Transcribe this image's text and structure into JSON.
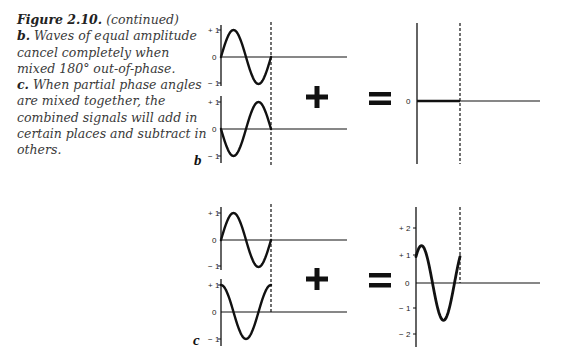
{
  "caption": {
    "figure_label": "Figure 2.10.",
    "figure_note": "(continued)",
    "b_label": "b.",
    "b_text": "Waves of equal amplitude cancel completely when mixed 180° out-of-phase.",
    "c_label": "c.",
    "c_text": "When partial phase angles are mixed together, the combined signals will add in certain places and subtract in others."
  },
  "panels": {
    "b": {
      "letter": "b",
      "wave1_ticks": [
        "+ 1",
        "0",
        "− 1"
      ],
      "wave2_ticks": [
        "+ 1",
        "0",
        "− 1"
      ],
      "result_ticks": [
        "0"
      ],
      "operator_plus": "+",
      "operator_equals": "="
    },
    "c": {
      "letter": "c",
      "wave1_ticks": [
        "+ 1",
        "0",
        "− 1"
      ],
      "wave2_ticks": [
        "+ 1",
        "0",
        "− 1"
      ],
      "result_ticks": [
        "+ 2",
        "+ 1",
        "0",
        "− 1",
        "− 2"
      ],
      "operator_plus": "+",
      "operator_equals": "="
    }
  },
  "chart_data": [
    {
      "type": "line",
      "title": "b: sine + inverted sine (180° out of phase) = silence",
      "series": [
        {
          "name": "wave 1",
          "phase_deg": 0,
          "amplitude": 1,
          "cycles": 1
        },
        {
          "name": "wave 2",
          "phase_deg": 180,
          "amplitude": 1,
          "cycles": 1
        },
        {
          "name": "sum",
          "amplitude": 0,
          "cycles": 1
        }
      ],
      "ylim": [
        -1,
        1
      ]
    },
    {
      "type": "line",
      "title": "c: sine + cosine (90° phase shift) = partial reinforcement",
      "series": [
        {
          "name": "wave 1",
          "phase_deg": 0,
          "amplitude": 1,
          "cycles": 1
        },
        {
          "name": "wave 2",
          "phase_deg": 90,
          "amplitude": 1,
          "cycles": 1
        },
        {
          "name": "sum",
          "phase_deg": 45,
          "amplitude": 1.41,
          "cycles": 1
        }
      ],
      "ylim": [
        -2,
        2
      ]
    }
  ]
}
